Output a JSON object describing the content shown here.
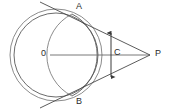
{
  "figure": {
    "background_color": "#ffffff",
    "stroke_color": "#4a4a4a",
    "label_color": "#2b2b2b",
    "width": 170,
    "height": 111,
    "labels": {
      "A": "A",
      "B": "B",
      "O": "0",
      "C": "C",
      "P": "P"
    },
    "points": {
      "O": {
        "x": 56,
        "y": 55,
        "name": "circle-center"
      },
      "A": {
        "x": 72,
        "y": 14,
        "name": "upper-tangent-point"
      },
      "B": {
        "x": 72,
        "y": 96,
        "name": "lower-tangent-point"
      },
      "P": {
        "x": 150,
        "y": 55,
        "name": "external-point"
      },
      "C": {
        "x": 111,
        "y": 55,
        "name": "chord-midpoint"
      }
    },
    "main_circle": {
      "cx": 56,
      "cy": 55,
      "r": 42,
      "name": "main-circle"
    },
    "secondary_arc": {
      "cx": 56,
      "cy": 55,
      "r": 46,
      "name": "secondary-circle-arc"
    },
    "segments": {
      "center_line": {
        "from": "O",
        "to": "P"
      },
      "tangent_upper": {
        "from": "P",
        "to": "A"
      },
      "tangent_lower": {
        "from": "P",
        "to": "B"
      }
    },
    "measure_arrow": {
      "x": 111,
      "y_top": 31,
      "y_bottom": 79,
      "label": "C",
      "name": "vertical-double-arrow"
    }
  }
}
